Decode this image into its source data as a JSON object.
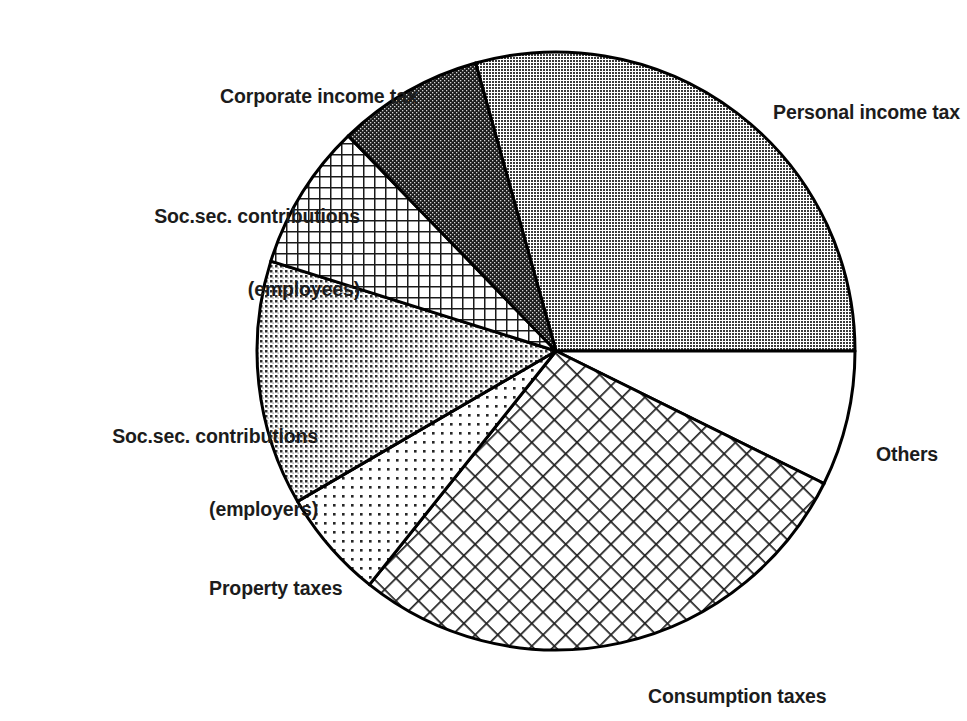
{
  "chart_data": {
    "type": "pie",
    "title": "",
    "subtitle": "",
    "xlabel": "",
    "ylabel": "",
    "grid": false,
    "legend_position": "callout-labels",
    "center": {
      "x": 556,
      "y": 351
    },
    "radius": 299,
    "start_angle_deg": -15.6,
    "direction": "clockwise",
    "categories": [
      "Personal income tax",
      "Others",
      "Consumption taxes",
      "Property taxes",
      "Soc.sec. contributions (employers)",
      "Soc.sec. contributions (employees)",
      "Corporate income tax"
    ],
    "values": [
      29.3,
      7.3,
      28.4,
      5.9,
      13.2,
      7.9,
      7.9
    ],
    "value_unit": "percent",
    "slices": [
      {
        "label": "Personal income tax",
        "label_line1": "Personal income tax",
        "label_line2": "",
        "value": 29.3,
        "sweep_deg": 105.6,
        "start_deg": -15.6,
        "end_deg": 90.0,
        "fill": "medium-gray-dot-screen",
        "fill_color": "#878787"
      },
      {
        "label": "Others",
        "label_line1": "Others",
        "label_line2": "",
        "value": 7.3,
        "sweep_deg": 26.3,
        "start_deg": 90.0,
        "end_deg": 116.3,
        "fill": "white-blank",
        "fill_color": "#ffffff"
      },
      {
        "label": "Consumption taxes",
        "label_line1": "Consumption taxes",
        "label_line2": "",
        "value": 28.4,
        "sweep_deg": 102.3,
        "start_deg": 116.3,
        "end_deg": 218.6,
        "fill": "coarse-cross-hatch-diagonal",
        "fill_color": "#2b2b2b"
      },
      {
        "label": "Property taxes",
        "label_line1": "Property taxes",
        "label_line2": "",
        "value": 5.9,
        "sweep_deg": 21.2,
        "start_deg": 218.6,
        "end_deg": 239.8,
        "fill": "light-dot-screen",
        "fill_color": "#d8d8d8"
      },
      {
        "label": "Soc.sec. contributions (employers)",
        "label_line1": "Soc.sec. contributions",
        "label_line2": "(employers)",
        "value": 13.2,
        "sweep_deg": 47.7,
        "start_deg": 239.8,
        "end_deg": 287.5,
        "fill": "medium-dot-screen",
        "fill_color": "#b0b0b0"
      },
      {
        "label": "Soc.sec. contributions (employees)",
        "label_line1": "Soc.sec. contributions",
        "label_line2": "(employees)",
        "value": 7.9,
        "sweep_deg": 28.5,
        "start_deg": 287.5,
        "end_deg": 316.0,
        "fill": "fine-grid-hatch",
        "fill_color": "#3a3a3a"
      },
      {
        "label": "Corporate income tax",
        "label_line1": "Corporate income tax",
        "label_line2": "",
        "value": 7.9,
        "sweep_deg": 28.4,
        "start_deg": 316.0,
        "end_deg": 344.4,
        "fill": "dark-fine-checker",
        "fill_color": "#3d3d3d"
      }
    ]
  },
  "labels": {
    "corporate_income_tax": "Corporate income tax",
    "ssc_employees_line1": "Soc.sec. contributions",
    "ssc_employees_line2": "(employees)",
    "ssc_employers_line1": "Soc.sec. contributions",
    "ssc_employers_line2": "(employers)",
    "property_taxes": "Property taxes",
    "consumption_taxes": "Consumption taxes",
    "others": "Others",
    "personal_income_tax": "Personal income tax"
  },
  "colors": {
    "outline": "#000000",
    "background": "#ffffff",
    "text": "#1c1c1c"
  }
}
